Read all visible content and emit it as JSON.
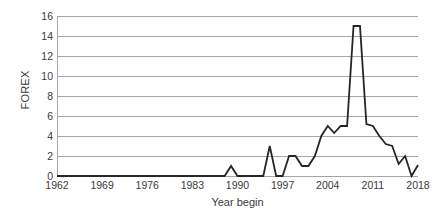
{
  "chart_data": {
    "type": "line",
    "title": "",
    "xlabel": "Year begin",
    "ylabel": "FOREX",
    "xlim": [
      1962,
      2018
    ],
    "ylim": [
      0,
      16
    ],
    "grid": true,
    "legend": "none",
    "line_color": "#262626",
    "grid_color": "#a6a6a6",
    "text_color": "#3a3a3a",
    "y_ticks": [
      0,
      2,
      4,
      6,
      8,
      10,
      12,
      14,
      16
    ],
    "x_ticks": [
      1962,
      1969,
      1976,
      1983,
      1990,
      1997,
      2004,
      2011,
      2018
    ],
    "x": [
      1962,
      1963,
      1964,
      1965,
      1966,
      1967,
      1968,
      1969,
      1970,
      1971,
      1972,
      1973,
      1974,
      1975,
      1976,
      1977,
      1978,
      1979,
      1980,
      1981,
      1982,
      1983,
      1984,
      1985,
      1986,
      1987,
      1988,
      1989,
      1990,
      1991,
      1992,
      1993,
      1994,
      1995,
      1996,
      1997,
      1998,
      1999,
      2000,
      2001,
      2002,
      2003,
      2004,
      2005,
      2006,
      2007,
      2008,
      2009,
      2010,
      2011,
      2012,
      2013,
      2014,
      2015,
      2016,
      2017,
      2018
    ],
    "y": [
      0,
      0,
      0,
      0,
      0,
      0,
      0,
      0,
      0,
      0,
      0,
      0,
      0,
      0,
      0,
      0,
      0,
      0,
      0,
      0,
      0,
      0,
      0,
      0,
      0,
      0,
      0,
      1,
      0,
      0,
      0,
      0,
      0,
      3,
      0,
      0,
      2,
      2,
      1,
      1,
      2,
      4,
      5,
      4.3,
      5,
      5,
      15,
      15,
      5.2,
      5,
      4,
      3.2,
      3,
      1.2,
      2,
      0,
      1.1
    ],
    "series_name": "FOREX"
  },
  "axes": {
    "y_title": "FOREX",
    "x_title": "Year begin",
    "y_tick_labels": [
      "16",
      "14",
      "12",
      "10",
      "8",
      "6",
      "4",
      "2",
      "0"
    ],
    "x_tick_labels": [
      "1962",
      "1969",
      "1976",
      "1983",
      "1990",
      "1997",
      "2004",
      "2011",
      "2018"
    ]
  }
}
